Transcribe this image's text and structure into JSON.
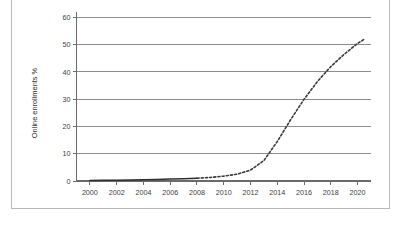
{
  "page": {
    "background_color": "#ffffff",
    "frame_border_color": "#b9b9b9"
  },
  "chart_data": {
    "type": "line",
    "title": "",
    "subtitle": "",
    "xlabel": "",
    "ylabel": "Online enrollments %",
    "xlim": [
      1999,
      2021
    ],
    "ylim": [
      0,
      62
    ],
    "grid": true,
    "grid_axis": "y",
    "legend": false,
    "legend_position": "none",
    "x_tick_labels": [
      "2000",
      "2002",
      "2004",
      "2006",
      "2008",
      "2010",
      "2012",
      "2014",
      "2016",
      "2018",
      "2020"
    ],
    "x_tick_values": [
      2000,
      2002,
      2004,
      2006,
      2008,
      2010,
      2012,
      2014,
      2016,
      2018,
      2020
    ],
    "y_tick_labels": [
      "0",
      "10",
      "20",
      "30",
      "40",
      "50",
      "60"
    ],
    "y_tick_values": [
      0,
      10,
      20,
      30,
      40,
      50,
      60
    ],
    "series": [
      {
        "name": "Online enrollments %",
        "style": "solid",
        "color": "#2e2e2e",
        "x": [
          2000,
          2001,
          2002,
          2003,
          2004,
          2005,
          2006,
          2007,
          2008
        ],
        "values": [
          0.2,
          0.25,
          0.3,
          0.35,
          0.45,
          0.55,
          0.7,
          0.85,
          1.0
        ]
      },
      {
        "name": "Online enrollments % (projected)",
        "style": "dashed",
        "color": "#3a3a3a",
        "x": [
          2008,
          2009,
          2010,
          2011,
          2012,
          2013,
          2014,
          2015,
          2016,
          2017,
          2018,
          2019,
          2020,
          2020.5
        ],
        "values": [
          1.0,
          1.3,
          1.8,
          2.5,
          4.0,
          7.5,
          14.5,
          22.5,
          30.0,
          36.5,
          42.0,
          46.5,
          50.5,
          52.0
        ]
      }
    ]
  }
}
